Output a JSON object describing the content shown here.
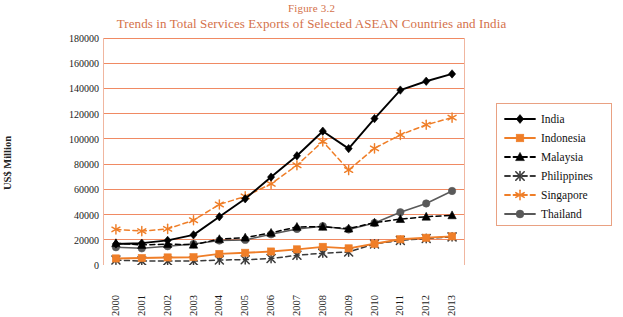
{
  "figure": {
    "label_caps": "F",
    "label_rest": "IGURE",
    "label_full": "Figure 3.2",
    "number": "3.2",
    "title": "Trends in Total Services Exports of Selected ASEAN Countries and India"
  },
  "colors": {
    "title": "#d4714a",
    "gridline": "#f08a63",
    "plot_border": "#f0b6a0",
    "india": "#000000",
    "indonesia": "#ef7e28",
    "malaysia": "#000000",
    "philippines": "#3a3a3a",
    "singapore": "#ef7e28",
    "thailand": "#595959",
    "legend_border": "#e9a182"
  },
  "axes": {
    "ylabel": "US$ Million",
    "yticks": [
      0,
      20000,
      40000,
      60000,
      80000,
      100000,
      120000,
      140000,
      160000,
      180000
    ],
    "ytick_labels": [
      "0",
      "20000",
      "40000",
      "60000",
      "80000",
      "100000",
      "120000",
      "140000",
      "160000",
      "180000"
    ],
    "ylim": [
      0,
      180000
    ],
    "xticks": [
      "2000",
      "2001",
      "2002",
      "2003",
      "2004",
      "2005",
      "2006",
      "2007",
      "2008",
      "2009",
      "2010",
      "2011",
      "2012",
      "2013"
    ],
    "grid": true,
    "xlabel": ""
  },
  "legend": {
    "position": "right",
    "items": [
      {
        "label": "India",
        "marker": "diamond",
        "dash": "solid",
        "color": "#000000"
      },
      {
        "label": "Indonesia",
        "marker": "square",
        "dash": "solid",
        "color": "#ef7e28"
      },
      {
        "label": "Malaysia",
        "marker": "triangle",
        "dash": "dashed",
        "color": "#000000"
      },
      {
        "label": "Philippines",
        "marker": "cross",
        "dash": "dashed",
        "color": "#3a3a3a"
      },
      {
        "label": "Singapore",
        "marker": "asterisk",
        "dash": "dashed",
        "color": "#ef7e28"
      },
      {
        "label": "Thailand",
        "marker": "circle",
        "dash": "solid",
        "color": "#595959"
      }
    ]
  },
  "chart_data": {
    "type": "line",
    "title": "Trends in Total Services Exports of Selected ASEAN Countries and India",
    "xlabel": "",
    "ylabel": "US$ Million",
    "ylim": [
      0,
      180000
    ],
    "grid": true,
    "legend_position": "right",
    "categories": [
      "2000",
      "2001",
      "2002",
      "2003",
      "2004",
      "2005",
      "2006",
      "2007",
      "2008",
      "2009",
      "2010",
      "2011",
      "2012",
      "2013"
    ],
    "series": [
      {
        "name": "India",
        "color": "#000000",
        "marker": "diamond",
        "dash": "solid",
        "values": [
          16700,
          17300,
          19500,
          23900,
          38300,
          52500,
          69700,
          86600,
          106100,
          92300,
          116100,
          138700,
          145700,
          151500
        ]
      },
      {
        "name": "Indonesia",
        "color": "#ef7e28",
        "marker": "square",
        "dash": "solid",
        "values": [
          5200,
          5500,
          6000,
          6200,
          8800,
          9700,
          10700,
          12400,
          14400,
          13200,
          16800,
          20400,
          21600,
          22700
        ]
      },
      {
        "name": "Malaysia",
        "color": "#000000",
        "marker": "triangle",
        "dash": "dashed",
        "values": [
          17300,
          15900,
          16600,
          16100,
          20500,
          21700,
          25500,
          30200,
          30300,
          28900,
          33600,
          36400,
          38300,
          39400
        ]
      },
      {
        "name": "Philippines",
        "color": "#3a3a3a",
        "marker": "cross",
        "dash": "dashed",
        "values": [
          3900,
          3100,
          3100,
          3100,
          4000,
          4200,
          5100,
          7700,
          9400,
          10300,
          16700,
          19500,
          21000,
          22300
        ]
      },
      {
        "name": "Singapore",
        "color": "#ef7e28",
        "marker": "asterisk",
        "dash": "dashed",
        "values": [
          28200,
          26900,
          28600,
          35500,
          48000,
          54400,
          64300,
          79100,
          98000,
          75300,
          92500,
          103200,
          111200,
          116900
        ]
      },
      {
        "name": "Thailand",
        "color": "#595959",
        "marker": "circle",
        "dash": "solid",
        "values": [
          14100,
          13200,
          14900,
          16600,
          19400,
          19900,
          24300,
          28600,
          30800,
          28200,
          33300,
          41800,
          48800,
          58700
        ]
      }
    ]
  }
}
